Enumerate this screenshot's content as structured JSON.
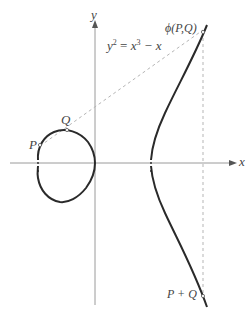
{
  "diagram": {
    "equation": {
      "lhs": "y",
      "lhs_exp": "2",
      "rhs_base": "x",
      "rhs_exp": "3",
      "rhs_rest": " − x"
    },
    "axes": {
      "x_label": "x",
      "y_label": "y"
    },
    "points": {
      "P": "P",
      "Q": "Q",
      "phi": "ϕ(P,Q)",
      "sum": "P + Q"
    },
    "colors": {
      "curve": "#2a2a2a",
      "axis": "#8a8a8a",
      "dashed": "#b0b0b0",
      "label": "#444444"
    }
  }
}
